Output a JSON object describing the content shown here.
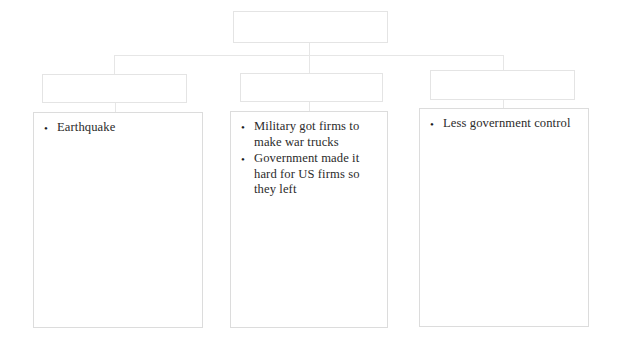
{
  "diagram": {
    "type": "hierarchy-tree",
    "title": "",
    "levels": 3,
    "colors": {
      "background": "#ffffff",
      "box_border": "#e2e2e2",
      "connector": "#e6e6e6",
      "text": "#2b2b2b"
    },
    "root": {
      "id": "root",
      "label": "",
      "text": ""
    },
    "branches": [
      {
        "id": "branch-1",
        "header": {
          "label": "",
          "text": ""
        },
        "detail": {
          "items": [
            "Earthquake"
          ]
        }
      },
      {
        "id": "branch-2",
        "header": {
          "label": "",
          "text": ""
        },
        "detail": {
          "items": [
            "Military got firms to make war trucks",
            "Government made it hard for US firms so they left"
          ]
        }
      },
      {
        "id": "branch-3",
        "header": {
          "label": "",
          "text": ""
        },
        "detail": {
          "items": [
            "Less government control"
          ]
        }
      }
    ]
  }
}
